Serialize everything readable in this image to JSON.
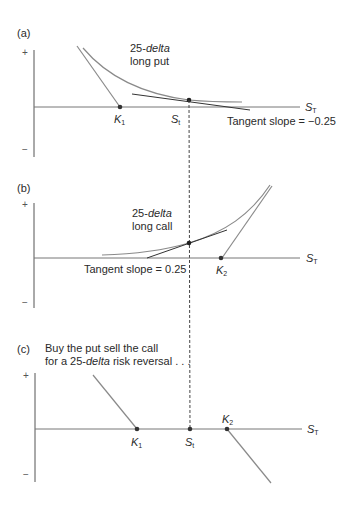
{
  "panels": {
    "a": {
      "label": "(a)",
      "title_italic": "25-delta",
      "title_line1_prefix": "25-",
      "title_line1_italic": "delta",
      "title_line2": "long put",
      "k_label": "K",
      "k_sub": "1",
      "s_label": "S",
      "s_sub": "t",
      "axis_label": "S",
      "axis_sub": "T",
      "tangent_text": "Tangent slope = −0.25",
      "plus": "+",
      "minus": "−"
    },
    "b": {
      "label": "(b)",
      "title_line1_prefix": "25-",
      "title_line1_italic": "delta",
      "title_line2": "long call",
      "k_label": "K",
      "k_sub": "2",
      "axis_label": "S",
      "axis_sub": "T",
      "tangent_text": "Tangent slope = 0.25",
      "plus": "+",
      "minus": "−"
    },
    "c": {
      "label": "(c)",
      "caption_line1": "Buy the put sell the call",
      "caption_line2_prefix": "for a 25-",
      "caption_line2_italic": "delta",
      "caption_line2_suffix": " risk reversal . . .",
      "k1_label": "K",
      "k1_sub": "1",
      "s_label": "S",
      "s_sub": "t",
      "k2_label": "K",
      "k2_sub": "2",
      "axis_label": "S",
      "axis_sub": "T",
      "plus": "+",
      "minus": "−"
    }
  },
  "colors": {
    "line": "#8a8a8a",
    "dark": "#2a2a2a",
    "dot": "#333333"
  }
}
